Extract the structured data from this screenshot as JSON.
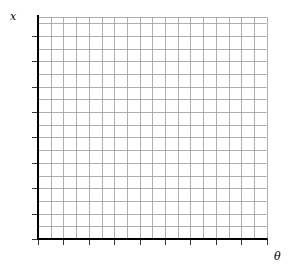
{
  "diagram": {
    "type": "blank-graph-grid",
    "y_axis_label": "x",
    "x_axis_label": "θ",
    "grid": {
      "columns": 18,
      "rows": 17.5,
      "cell_px": 12.7,
      "minor_color": "#9a9a9a",
      "axis_color": "#000000"
    },
    "x_axis_major_ticks": 9,
    "y_axis_major_ticks": 8
  }
}
